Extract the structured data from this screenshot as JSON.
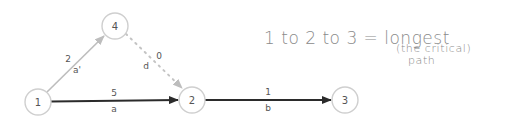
{
  "diagram": {
    "type": "activity-on-arrow network",
    "nodes": [
      {
        "id": "1",
        "label": "1",
        "cx": 38,
        "cy": 102
      },
      {
        "id": "2",
        "label": "2",
        "cx": 192,
        "cy": 100
      },
      {
        "id": "3",
        "label": "3",
        "cx": 345,
        "cy": 100
      },
      {
        "id": "4",
        "label": "4",
        "cx": 115,
        "cy": 26
      }
    ],
    "edges": [
      {
        "from": "1",
        "to": "4",
        "duration": "2",
        "activity": "a'",
        "style": "solid-gray"
      },
      {
        "from": "4",
        "to": "2",
        "duration": "0",
        "activity": "d",
        "style": "dotted-gray"
      },
      {
        "from": "1",
        "to": "2",
        "duration": "5",
        "activity": "a",
        "style": "solid-dark"
      },
      {
        "from": "2",
        "to": "3",
        "duration": "1",
        "activity": "b",
        "style": "solid-dark"
      }
    ],
    "colors": {
      "critical_edge": "#2b2b2b",
      "secondary_edge": "#bdbdbd",
      "dummy_edge": "#c4c4c4",
      "node_stroke": "#cfcfcf",
      "annotation": "#8a8a8a"
    }
  },
  "annotation": {
    "line1": "1 to 2 to 3 = longest",
    "line2": "(the critical)",
    "line3": "path"
  }
}
